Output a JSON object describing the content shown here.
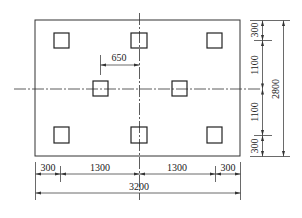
{
  "drawing": {
    "type": "pile cap plan",
    "outline": {
      "width_mm": 3200,
      "height_mm": 2800
    },
    "piles": [
      {
        "id": "top-left"
      },
      {
        "id": "top-center"
      },
      {
        "id": "top-right"
      },
      {
        "id": "middle-left"
      },
      {
        "id": "middle-right"
      },
      {
        "id": "bottom-left"
      },
      {
        "id": "bottom-center"
      },
      {
        "id": "bottom-right"
      }
    ],
    "dimensions": {
      "offset_650": "650",
      "bottom_chain": [
        "300",
        "1300",
        "1300",
        "300"
      ],
      "bottom_total": "3200",
      "right_chain": [
        "300",
        "1100",
        "1100",
        "300"
      ],
      "right_total": "2800"
    }
  }
}
